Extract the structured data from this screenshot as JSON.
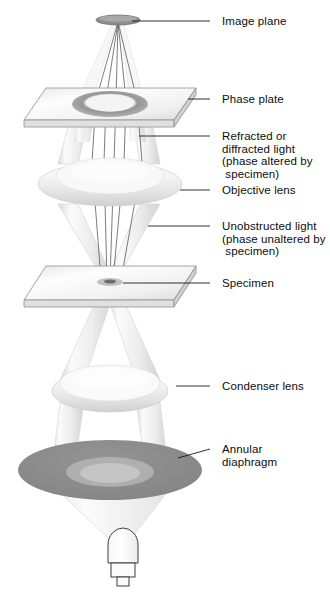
{
  "figure": {
    "type": "optical-ray-diagram",
    "background_color": "#ffffff",
    "label_color": "#0d0d0d",
    "beam_color": "#f2f2f2",
    "beam_edge_color": "#cfcfcf",
    "ray_color": "#5a5a5a",
    "diaphragm_color": "#8a8a8a",
    "glass_color": "#f0f0f0",
    "glass_edge_color": "#9a9a9a",
    "lens_color": "#f4f4f4"
  },
  "labels": [
    {
      "id": "image-plane",
      "text": "Image plane",
      "x": 222,
      "y": 15,
      "leader_from_x": 210,
      "leader_from_y": 21,
      "leader_to_x": 132,
      "leader_to_y": 21
    },
    {
      "id": "phase-plate",
      "text": "Phase plate",
      "x": 222,
      "y": 93,
      "leader_from_x": 210,
      "leader_from_y": 99,
      "leader_to_x": 188,
      "leader_to_y": 99
    },
    {
      "id": "refracted-light",
      "text": "Refracted or\ndiffracted light\n(phase altered by\n specimen)",
      "x": 222,
      "y": 130,
      "leader_from_x": 210,
      "leader_from_y": 136,
      "leader_to_x": 139,
      "leader_to_y": 136
    },
    {
      "id": "objective-lens",
      "text": "Objective lens",
      "x": 222,
      "y": 184,
      "leader_from_x": 210,
      "leader_from_y": 190,
      "leader_to_x": 180,
      "leader_to_y": 190
    },
    {
      "id": "unobstructed-light",
      "text": "Unobstructed light\n(phase unaltered by\n specimen)",
      "x": 222,
      "y": 220,
      "leader_from_x": 210,
      "leader_from_y": 226,
      "leader_to_x": 148,
      "leader_to_y": 226
    },
    {
      "id": "specimen",
      "text": "Specimen",
      "x": 222,
      "y": 277,
      "leader_from_x": 210,
      "leader_from_y": 283,
      "leader_to_x": 123,
      "leader_to_y": 283
    },
    {
      "id": "condenser-lens",
      "text": "Condenser lens",
      "x": 222,
      "y": 380,
      "leader_from_x": 210,
      "leader_from_y": 386,
      "leader_to_x": 176,
      "leader_to_y": 386
    },
    {
      "id": "annular-diaphragm",
      "text": "Annular\ndiaphragm",
      "x": 222,
      "y": 443,
      "leader_from_x": 210,
      "leader_from_y": 449,
      "leader_to_x": 178,
      "leader_to_y": 458
    }
  ],
  "components": [
    {
      "id": "image-plane-disc",
      "name": "image plane",
      "cx": 118,
      "cy": 20,
      "rx": 22,
      "ry": 5
    },
    {
      "id": "phase-plate-slab",
      "name": "phase plate",
      "cx": 110,
      "cy": 105,
      "width": 175,
      "thickness": 8
    },
    {
      "id": "phase-plate-ring",
      "name": "phase plate annulus",
      "cx": 110,
      "cy": 104,
      "rx": 38,
      "ry": 13
    },
    {
      "id": "objective-lens-body",
      "name": "objective lens",
      "cx": 110,
      "cy": 182,
      "rx": 72,
      "ry": 24
    },
    {
      "id": "specimen-slide",
      "name": "specimen slide",
      "cx": 110,
      "cy": 285,
      "width": 175,
      "thickness": 8
    },
    {
      "id": "specimen-spot",
      "name": "specimen",
      "cx": 110,
      "cy": 283,
      "rx": 13,
      "ry": 4
    },
    {
      "id": "condenser-lens-body",
      "name": "condenser lens",
      "cx": 110,
      "cy": 389,
      "rx": 58,
      "ry": 24
    },
    {
      "id": "annular-diaphragm-disc",
      "name": "annular diaphragm",
      "cx": 110,
      "cy": 473,
      "rx": 92,
      "ry": 30
    },
    {
      "id": "light-bulb",
      "name": "light source bulb",
      "cx": 122,
      "cy": 556,
      "width": 30,
      "height": 44
    }
  ]
}
